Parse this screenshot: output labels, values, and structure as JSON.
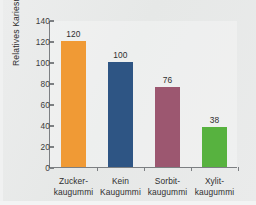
{
  "chart_data": {
    "type": "bar",
    "title": "",
    "xlabel": "",
    "ylabel": "Relatives Kariesrisiko",
    "categories": [
      "Zucker-\nkaugummi",
      "Kein\nKaugummi",
      "Sorbit-\nkaugummi",
      "Xylit-\nkaugummi"
    ],
    "category_lines": [
      [
        "Zucker-",
        "kaugummi"
      ],
      [
        "Kein",
        "Kaugummi"
      ],
      [
        "Sorbit-",
        "kaugummi"
      ],
      [
        "Xylit-",
        "kaugummi"
      ]
    ],
    "values": [
      120,
      100,
      76,
      38
    ],
    "value_labels": [
      "120",
      "100",
      "76",
      "38"
    ],
    "bar_colors": [
      "#f09a35",
      "#2e5584",
      "#9c5770",
      "#57b23f"
    ],
    "ylim": [
      0,
      140
    ],
    "yticks": [
      0,
      20,
      40,
      60,
      80,
      100,
      120,
      140
    ],
    "ytick_labels": [
      "0",
      "20",
      "40",
      "60",
      "80",
      "100",
      "120",
      "140"
    ],
    "grid": false,
    "legend": "none",
    "axis_color": "#7c7f82",
    "background_color": "#e9eaea"
  }
}
